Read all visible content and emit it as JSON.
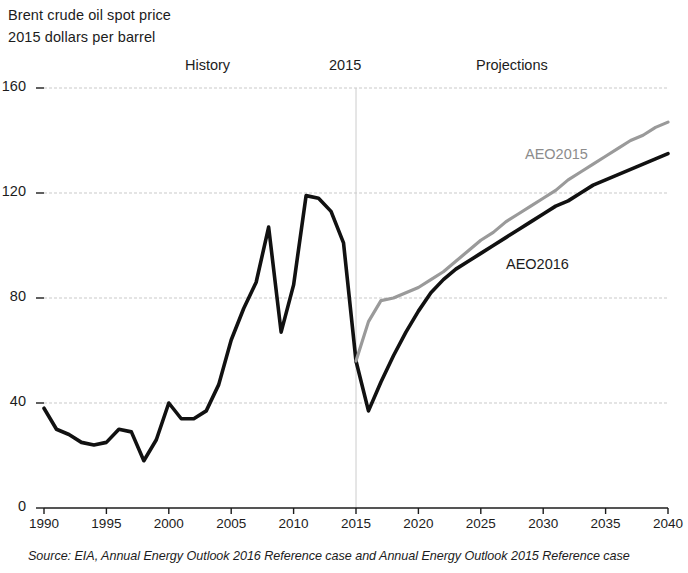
{
  "figure": {
    "title_lines": [
      "Brent crude oil spot price",
      "2015 dollars per barrel"
    ],
    "source_note": "Source:  EIA, Annual Energy Outlook 2016 Reference case and Annual Energy Outlook 2015 Reference case",
    "section_labels": {
      "history": "History",
      "split_year": "2015",
      "projections": "Projections"
    }
  },
  "chart_data": {
    "type": "line",
    "title": "Brent crude oil spot price",
    "subtitle": "2015 dollars per barrel",
    "xlabel": "",
    "ylabel": "2015 dollars per barrel",
    "xlim": [
      1990,
      2040
    ],
    "ylim": [
      0,
      160
    ],
    "yticks": [
      0,
      40,
      80,
      120,
      160
    ],
    "ytick_labels": [
      "0",
      "40",
      "80",
      "120",
      "160"
    ],
    "xticks": [
      1990,
      1995,
      2000,
      2005,
      2010,
      2015,
      2020,
      2025,
      2030,
      2035,
      2040
    ],
    "xtick_labels": [
      "1990",
      "1995",
      "2000",
      "2005",
      "2010",
      "2015",
      "2020",
      "2025",
      "2030",
      "2035",
      "2040"
    ],
    "grid": "horizontal",
    "legend": "inline-annotations",
    "annotations": [
      {
        "text": "History",
        "x": 2001,
        "region": "above-plot"
      },
      {
        "text": "2015",
        "x": 2015,
        "region": "above-plot"
      },
      {
        "text": "Projections",
        "x": 2027,
        "region": "above-plot"
      },
      {
        "text": "AEO2015",
        "x": 2034,
        "y": 142,
        "color": "#8c8c8c"
      },
      {
        "text": "AEO2016",
        "x": 2032,
        "y": 93,
        "color": "#1c1c1c"
      }
    ],
    "vertical_divider": {
      "x": 2015,
      "color": "#cccccc",
      "style": "solid-faint"
    },
    "series": [
      {
        "name": "History",
        "color": "#111111",
        "width": 3.6,
        "x": [
          1990,
          1991,
          1992,
          1993,
          1994,
          1995,
          1996,
          1997,
          1998,
          1999,
          2000,
          2001,
          2002,
          2003,
          2004,
          2005,
          2006,
          2007,
          2008,
          2009,
          2010,
          2011,
          2012,
          2013,
          2014,
          2015
        ],
        "values": [
          38,
          30,
          28,
          25,
          24,
          25,
          30,
          29,
          18,
          26,
          40,
          34,
          34,
          37,
          47,
          64,
          76,
          86,
          107,
          67,
          85,
          119,
          118,
          113,
          101,
          56
        ]
      },
      {
        "name": "AEO2016",
        "color": "#111111",
        "width": 3.6,
        "x": [
          2015,
          2016,
          2017,
          2018,
          2019,
          2020,
          2021,
          2022,
          2023,
          2024,
          2025,
          2026,
          2027,
          2028,
          2029,
          2030,
          2031,
          2032,
          2033,
          2034,
          2035,
          2036,
          2037,
          2038,
          2039,
          2040
        ],
        "values": [
          56,
          37,
          48,
          58,
          67,
          75,
          82,
          87,
          91,
          94,
          97,
          100,
          103,
          106,
          109,
          112,
          115,
          117,
          120,
          123,
          125,
          127,
          129,
          131,
          133,
          135
        ]
      },
      {
        "name": "AEO2015",
        "color": "#9a9a9a",
        "width": 3.2,
        "x": [
          2015,
          2016,
          2017,
          2018,
          2019,
          2020,
          2021,
          2022,
          2023,
          2024,
          2025,
          2026,
          2027,
          2028,
          2029,
          2030,
          2031,
          2032,
          2033,
          2034,
          2035,
          2036,
          2037,
          2038,
          2039,
          2040
        ],
        "values": [
          56,
          71,
          79,
          80,
          82,
          84,
          87,
          90,
          94,
          98,
          102,
          105,
          109,
          112,
          115,
          118,
          121,
          125,
          128,
          131,
          134,
          137,
          140,
          142,
          145,
          147
        ]
      }
    ]
  }
}
